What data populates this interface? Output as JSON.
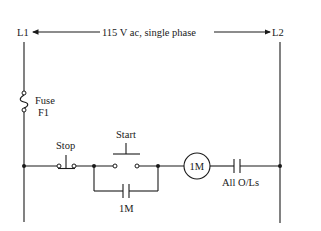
{
  "diagram": {
    "type": "ladder-diagram",
    "supply": {
      "left_rail_label": "L1",
      "right_rail_label": "L2",
      "voltage_label": "115 V ac, single phase"
    },
    "fuse": {
      "label_line1": "Fuse",
      "label_line2": "F1"
    },
    "rung": {
      "stop_button_label": "Stop",
      "start_button_label": "Start",
      "seal_in_contact_label": "1M",
      "coil_label": "1M",
      "overload_contacts_label": "All O/Ls"
    },
    "colors": {
      "line": "#1a1a1a",
      "background": "#ffffff"
    }
  }
}
